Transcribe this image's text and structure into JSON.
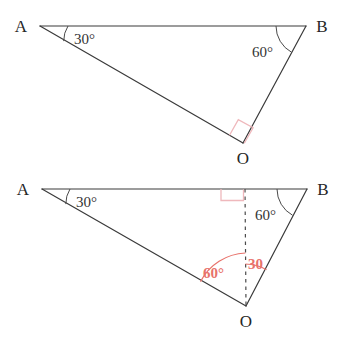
{
  "figure": {
    "background_color": "#ffffff",
    "stroke_color": "#3a3a3a",
    "accent_color": "#e8726b",
    "right_angle_color": "#efb8bc",
    "width": 343,
    "height": 341
  },
  "top_diagram": {
    "name": "triangle-abo-top",
    "vertices": {
      "A": {
        "label": "A",
        "x": 40,
        "y": 26,
        "label_x": 21,
        "label_y": 32
      },
      "B": {
        "label": "B",
        "x": 306,
        "y": 26,
        "label_x": 316,
        "label_y": 32
      },
      "O": {
        "label": "O",
        "x": 243,
        "y": 143,
        "label_x": 236,
        "label_y": 164
      }
    },
    "angles": [
      {
        "at": "A",
        "value": "30",
        "unit": "°",
        "text": "30°",
        "label_x": 75,
        "label_y": 43,
        "color": "#333333"
      },
      {
        "at": "B",
        "value": "60",
        "unit": "°",
        "text": "60°",
        "label_x": 253,
        "label_y": 55,
        "color": "#333333"
      },
      {
        "at": "O",
        "value": "90",
        "unit": "°",
        "text": "",
        "marker": "right-angle-square",
        "color": "#efb8bc"
      }
    ]
  },
  "bottom_diagram": {
    "name": "triangle-abo-bottom",
    "vertices": {
      "A": {
        "label": "A",
        "x": 42,
        "y": 189,
        "label_x": 23,
        "label_y": 195
      },
      "B": {
        "label": "B",
        "x": 307,
        "y": 189,
        "label_x": 317,
        "label_y": 195
      },
      "O": {
        "label": "O",
        "x": 246,
        "y": 306,
        "label_x": 239,
        "label_y": 327
      }
    },
    "construction": {
      "dashed_line_label": "perpendicular from O to AB",
      "foot_x": 245,
      "foot_y": 189,
      "right_angle_marker": true
    },
    "angles": [
      {
        "at": "A",
        "value": "30",
        "unit": "°",
        "text": "30°",
        "label_x": 77,
        "label_y": 206,
        "color": "#333333"
      },
      {
        "at": "B",
        "value": "60",
        "unit": "°",
        "text": "60°",
        "label_x": 256,
        "label_y": 218,
        "color": "#333333"
      },
      {
        "at": "O-left",
        "value": "60",
        "unit": "°",
        "text": "60°",
        "label_x": 206,
        "label_y": 277,
        "color": "#e8726b"
      },
      {
        "at": "O-right",
        "value": "30",
        "unit": "",
        "text": "30",
        "label_x": 249,
        "label_y": 268,
        "color": "#e8726b"
      }
    ]
  }
}
